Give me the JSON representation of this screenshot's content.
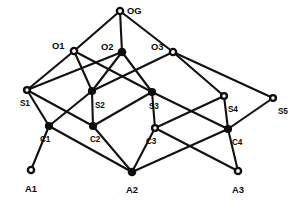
{
  "diagram": {
    "type": "layered-graph",
    "title": "",
    "style": {
      "background_color": "#ffffff",
      "edge_color": "#111111",
      "node_stroke_color": "#0d0d0d",
      "node_fill_color": "#ffffff",
      "label_color": "#0b0b0b"
    },
    "layers": [
      {
        "name": "goal",
        "labels": [
          "OG"
        ]
      },
      {
        "name": "objectives",
        "labels": [
          "O1",
          "O2",
          "O3"
        ]
      },
      {
        "name": "strategies",
        "labels": [
          "S1",
          "S2",
          "S3",
          "S4",
          "S5"
        ]
      },
      {
        "name": "capabilities",
        "labels": [
          "C1",
          "C2",
          "C3",
          "C4"
        ]
      },
      {
        "name": "assets",
        "labels": [
          "A1",
          "A2",
          "A3"
        ]
      }
    ],
    "nodes": [
      {
        "id": "OG",
        "label": "OG",
        "x": 120,
        "y": 11,
        "label_dx": 7,
        "label_dy": 3,
        "filled": false,
        "size": "big"
      },
      {
        "id": "O1",
        "label": "O1",
        "x": 74,
        "y": 51,
        "label_dx": -22,
        "label_dy": -2,
        "filled": false,
        "size": "big"
      },
      {
        "id": "O2",
        "label": "O2",
        "x": 122,
        "y": 52,
        "label_dx": -21,
        "label_dy": -2,
        "filled": true,
        "size": "big"
      },
      {
        "id": "O3",
        "label": "O3",
        "x": 173,
        "y": 52,
        "label_dx": -22,
        "label_dy": -2,
        "filled": false,
        "size": "big"
      },
      {
        "id": "S1",
        "label": "S1",
        "x": 27,
        "y": 90,
        "label_dx": -7,
        "label_dy": 16,
        "filled": false,
        "size": "normal"
      },
      {
        "id": "S2",
        "label": "S2",
        "x": 92,
        "y": 91,
        "label_dx": 3,
        "label_dy": 17,
        "filled": true,
        "size": "normal"
      },
      {
        "id": "S3",
        "label": "S3",
        "x": 152,
        "y": 92,
        "label_dx": -3,
        "label_dy": 17,
        "filled": true,
        "size": "normal"
      },
      {
        "id": "S4",
        "label": "S4",
        "x": 224,
        "y": 96,
        "label_dx": 4,
        "label_dy": 16,
        "filled": false,
        "size": "normal"
      },
      {
        "id": "S5",
        "label": "S5",
        "x": 273,
        "y": 98,
        "label_dx": 5,
        "label_dy": 16,
        "filled": false,
        "size": "normal"
      },
      {
        "id": "C1",
        "label": "C1",
        "x": 49,
        "y": 126,
        "label_dx": -9,
        "label_dy": 16,
        "filled": true,
        "size": "normal"
      },
      {
        "id": "C2",
        "label": "C2",
        "x": 93,
        "y": 126,
        "label_dx": -3,
        "label_dy": 16,
        "filled": true,
        "size": "normal"
      },
      {
        "id": "C3",
        "label": "C3",
        "x": 155,
        "y": 128,
        "label_dx": -9,
        "label_dy": 16,
        "filled": false,
        "size": "normal"
      },
      {
        "id": "C4",
        "label": "C4",
        "x": 228,
        "y": 129,
        "label_dx": 4,
        "label_dy": 16,
        "filled": true,
        "size": "normal"
      },
      {
        "id": "A1",
        "label": "A1",
        "x": 31,
        "y": 170,
        "label_dx": -6,
        "label_dy": 22,
        "filled": false,
        "size": "big"
      },
      {
        "id": "A2",
        "label": "A2",
        "x": 132,
        "y": 172,
        "label_dx": -6,
        "label_dy": 21,
        "filled": true,
        "size": "big"
      },
      {
        "id": "A3",
        "label": "A3",
        "x": 238,
        "y": 171,
        "label_dx": -6,
        "label_dy": 22,
        "filled": false,
        "size": "big"
      }
    ],
    "edges": [
      {
        "from": "OG",
        "to": "O1"
      },
      {
        "from": "OG",
        "to": "O2"
      },
      {
        "from": "OG",
        "to": "O3"
      },
      {
        "from": "O1",
        "to": "S1"
      },
      {
        "from": "O1",
        "to": "S2"
      },
      {
        "from": "O1",
        "to": "S3"
      },
      {
        "from": "O2",
        "to": "S1"
      },
      {
        "from": "O2",
        "to": "S2"
      },
      {
        "from": "O2",
        "to": "S3"
      },
      {
        "from": "O3",
        "to": "S2"
      },
      {
        "from": "O3",
        "to": "S4"
      },
      {
        "from": "O3",
        "to": "S5"
      },
      {
        "from": "S1",
        "to": "C1"
      },
      {
        "from": "S1",
        "to": "C2"
      },
      {
        "from": "S2",
        "to": "C1"
      },
      {
        "from": "S2",
        "to": "C2"
      },
      {
        "from": "S3",
        "to": "C2"
      },
      {
        "from": "S3",
        "to": "C3"
      },
      {
        "from": "S3",
        "to": "C4"
      },
      {
        "from": "S4",
        "to": "C3"
      },
      {
        "from": "S4",
        "to": "C4"
      },
      {
        "from": "S5",
        "to": "C4"
      },
      {
        "from": "C1",
        "to": "A1"
      },
      {
        "from": "C1",
        "to": "A2"
      },
      {
        "from": "C2",
        "to": "A2"
      },
      {
        "from": "C3",
        "to": "A2"
      },
      {
        "from": "C3",
        "to": "A3"
      },
      {
        "from": "C4",
        "to": "A2"
      },
      {
        "from": "C4",
        "to": "A3"
      }
    ]
  }
}
